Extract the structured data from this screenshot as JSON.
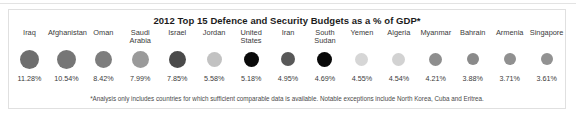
{
  "chart_data": {
    "type": "bar",
    "title": "2012 Top 15 Defence and Security Budgets as a % of GDP*",
    "xlabel": "",
    "ylabel": "Defence and Security Budget (% of GDP)",
    "categories": [
      "Iraq",
      "Afghanistan",
      "Oman",
      "Saudi Arabia",
      "Israel",
      "Jordan",
      "United States",
      "Iran",
      "South Sudan",
      "Yemen",
      "Algeria",
      "Myanmar",
      "Bahrain",
      "Armenia",
      "Singapore"
    ],
    "values": [
      11.28,
      10.54,
      8.42,
      7.99,
      7.85,
      5.58,
      5.18,
      4.95,
      4.69,
      4.55,
      4.54,
      4.21,
      3.88,
      3.71,
      3.61
    ],
    "value_labels": [
      "11.28%",
      "10.54%",
      "8.42%",
      "7.99%",
      "7.85%",
      "5.58%",
      "5.18%",
      "4.95%",
      "4.69%",
      "4.55%",
      "4.54%",
      "4.21%",
      "3.88%",
      "3.71%",
      "3.61%"
    ],
    "ylim": [
      0,
      12
    ],
    "grid": false,
    "legend": "none",
    "marker_colors": [
      "#6e6e6e",
      "#767676",
      "#7d7d7d",
      "#9a9a9a",
      "#4a4a4a",
      "#c2c2c2",
      "#0a0a0a",
      "#585858",
      "#090909",
      "#d6d6d6",
      "#d2d2d2",
      "#8e8e8e",
      "#8a8a8a",
      "#909090",
      "#929292"
    ],
    "marker_sizes": [
      19,
      19,
      17,
      17,
      17,
      15,
      15,
      14,
      15,
      13,
      13,
      13,
      12,
      12,
      12
    ],
    "annotation": "*Analysis only includes countries for which sufficient comparable data is available. Notable exceptions include North Korea, Cuba and Eritrea."
  },
  "chart": {
    "title": "2012 Top 15 Defence and Security Budgets as a % of GDP*",
    "footnote": "*Analysis only includes countries for which sufficient comparable data is available. Notable exceptions include North Korea, Cuba and Eritrea.",
    "columns": [
      {
        "label": "Iraq",
        "value": "11.28%",
        "color": "#6e6e6e",
        "size": 19
      },
      {
        "label": "Afghanistan",
        "value": "10.54%",
        "color": "#767676",
        "size": 19
      },
      {
        "label": "Oman",
        "value": "8.42%",
        "color": "#7d7d7d",
        "size": 17
      },
      {
        "label": "Saudi\nArabia",
        "value": "7.99%",
        "color": "#9a9a9a",
        "size": 17
      },
      {
        "label": "Israel",
        "value": "7.85%",
        "color": "#4a4a4a",
        "size": 17
      },
      {
        "label": "Jordan",
        "value": "5.58%",
        "color": "#c2c2c2",
        "size": 15
      },
      {
        "label": "United\nStates",
        "value": "5.18%",
        "color": "#0a0a0a",
        "size": 15
      },
      {
        "label": "Iran",
        "value": "4.95%",
        "color": "#585858",
        "size": 14
      },
      {
        "label": "South\nSudan",
        "value": "4.69%",
        "color": "#090909",
        "size": 15
      },
      {
        "label": "Yemen",
        "value": "4.55%",
        "color": "#d6d6d6",
        "size": 13
      },
      {
        "label": "Algeria",
        "value": "4.54%",
        "color": "#d2d2d2",
        "size": 13
      },
      {
        "label": "Myanmar",
        "value": "4.21%",
        "color": "#8e8e8e",
        "size": 13
      },
      {
        "label": "Bahrain",
        "value": "3.88%",
        "color": "#8a8a8a",
        "size": 12
      },
      {
        "label": "Armenia",
        "value": "3.71%",
        "color": "#909090",
        "size": 12
      },
      {
        "label": "Singapore",
        "value": "3.61%",
        "color": "#929292",
        "size": 12
      }
    ]
  },
  "colors": {
    "panel_border": "#e0e0e0",
    "title_text": "#1c1c1c",
    "body_text": "#3a3a3a",
    "footnote_text": "#4a4a4a",
    "background": "#ffffff"
  }
}
